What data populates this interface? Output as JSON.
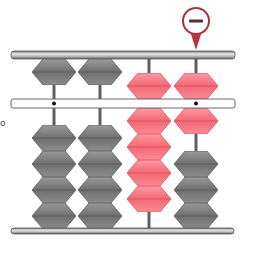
{
  "figure": {
    "title": "",
    "marker": {
      "symbol": "−",
      "type": "minus-sign",
      "column": 4,
      "color": "#c0303a"
    },
    "colors": {
      "frame": "#8a8a8a",
      "bead_gray": "#7d7d7d",
      "bead_pink": "#f47b86",
      "middle_bar_fill": "#ffffff"
    },
    "columns": [
      {
        "index": 1,
        "upper": [
          {
            "color": "gray",
            "position": "up"
          }
        ],
        "lower": [
          {
            "color": "gray"
          },
          {
            "color": "gray"
          },
          {
            "color": "gray"
          },
          {
            "color": "gray"
          }
        ],
        "lower_position": "down",
        "unit_dot": true
      },
      {
        "index": 2,
        "upper": [
          {
            "color": "gray",
            "position": "up"
          }
        ],
        "lower": [
          {
            "color": "gray"
          },
          {
            "color": "gray"
          },
          {
            "color": "gray"
          },
          {
            "color": "gray"
          }
        ],
        "lower_position": "down",
        "unit_dot": false
      },
      {
        "index": 3,
        "upper": [
          {
            "color": "pink",
            "position": "down"
          }
        ],
        "lower": [
          {
            "color": "pink"
          },
          {
            "color": "pink"
          },
          {
            "color": "pink"
          },
          {
            "color": "pink"
          }
        ],
        "lower_position": "up",
        "unit_dot": false
      },
      {
        "index": 4,
        "upper": [
          {
            "color": "pink",
            "position": "down"
          }
        ],
        "lower": [
          {
            "color": "pink"
          },
          {
            "color": "gray"
          },
          {
            "color": "gray"
          },
          {
            "color": "gray"
          }
        ],
        "lower_position": "split",
        "unit_dot": true
      }
    ],
    "side_label": "o"
  }
}
